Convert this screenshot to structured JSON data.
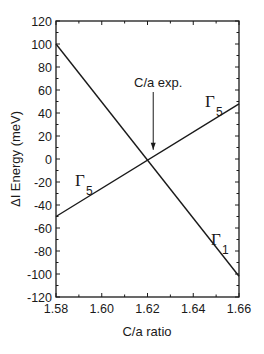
{
  "chart_data": {
    "type": "line",
    "title": "",
    "xlabel": "C/a ratio",
    "ylabel": "ΔΙ Energy (meV)",
    "xlim": [
      1.58,
      1.66
    ],
    "ylim": [
      -120,
      120
    ],
    "grid": false,
    "x_ticks": [
      "1.58",
      "1.60",
      "1.62",
      "1.64",
      "1.66"
    ],
    "y_ticks": [
      "120",
      "100",
      "80",
      "60",
      "40",
      "20",
      "0",
      "-20",
      "-40",
      "-60",
      "-80",
      "-100",
      "-120"
    ],
    "series": [
      {
        "name": "Γ₁",
        "x": [
          1.58,
          1.66
        ],
        "y": [
          100,
          -102
        ]
      },
      {
        "name": "Γ₅",
        "x": [
          1.58,
          1.66
        ],
        "y": [
          -50,
          48
        ]
      }
    ],
    "annotations": [
      {
        "text": "C/a exp.",
        "arrow_to_x": 1.6225,
        "arrow_to_y": 8
      },
      {
        "text": "Γ",
        "sub": "5",
        "near": "upper-right Γ₅ line"
      },
      {
        "text": "Γ",
        "sub": "5",
        "near": "left Γ₅ line"
      },
      {
        "text": "Γ",
        "sub": "1",
        "near": "right Γ₁ line"
      }
    ]
  },
  "labels": {
    "xlabel": "C/a ratio",
    "ylabel": "ΔΙ Energy (meV)",
    "annotation": "C/a exp.",
    "gamma": "Γ",
    "sub5": "5",
    "sub1": "1"
  }
}
